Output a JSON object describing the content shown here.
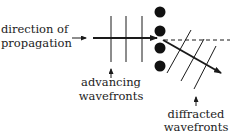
{
  "labels": {
    "direction_line1": "direction of",
    "direction_line2": "propagation",
    "advancing_line1": "advancing",
    "advancing_line2": "wavefronts",
    "diffracted_line1": "diffracted",
    "diffracted_line2": "wavefronts"
  },
  "colors": {
    "ink": "#1a1a1a",
    "background": "#ffffff"
  },
  "elements": {
    "barrier_dots": 4,
    "advancing_wavefront_count": 3,
    "diffracted_wavefront_count": 3
  }
}
